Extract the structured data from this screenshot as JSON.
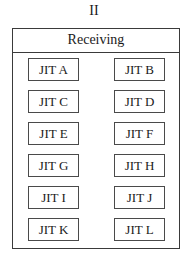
{
  "figure_label": "II",
  "panel": {
    "title": "Receiving",
    "items": [
      "JIT A",
      "JIT B",
      "JIT C",
      "JIT D",
      "JIT E",
      "JIT F",
      "JIT G",
      "JIT H",
      "JIT I",
      "JIT J",
      "JIT K",
      "JIT L"
    ]
  }
}
